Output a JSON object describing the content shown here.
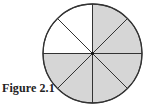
{
  "figure": {
    "caption": "Figure 2.1",
    "type": "fraction-circle",
    "total_sectors": 8,
    "shaded_sectors": 6,
    "unshaded_sectors": 2,
    "sectors": [
      {
        "index": 0,
        "from_deg": 0,
        "to_deg": 45,
        "shaded": true
      },
      {
        "index": 1,
        "from_deg": 45,
        "to_deg": 90,
        "shaded": true
      },
      {
        "index": 2,
        "from_deg": 90,
        "to_deg": 135,
        "shaded": false
      },
      {
        "index": 3,
        "from_deg": 135,
        "to_deg": 180,
        "shaded": false
      },
      {
        "index": 4,
        "from_deg": 180,
        "to_deg": 225,
        "shaded": true
      },
      {
        "index": 5,
        "from_deg": 225,
        "to_deg": 270,
        "shaded": true
      },
      {
        "index": 6,
        "from_deg": 270,
        "to_deg": 315,
        "shaded": true
      },
      {
        "index": 7,
        "from_deg": 315,
        "to_deg": 360,
        "shaded": true
      }
    ],
    "colors": {
      "shade": "#d6d6d6",
      "unshaded": "#ffffff",
      "stroke": "#333333"
    },
    "geometry": {
      "cx": 92.5,
      "cy": 53.5,
      "r": 49.5
    }
  }
}
